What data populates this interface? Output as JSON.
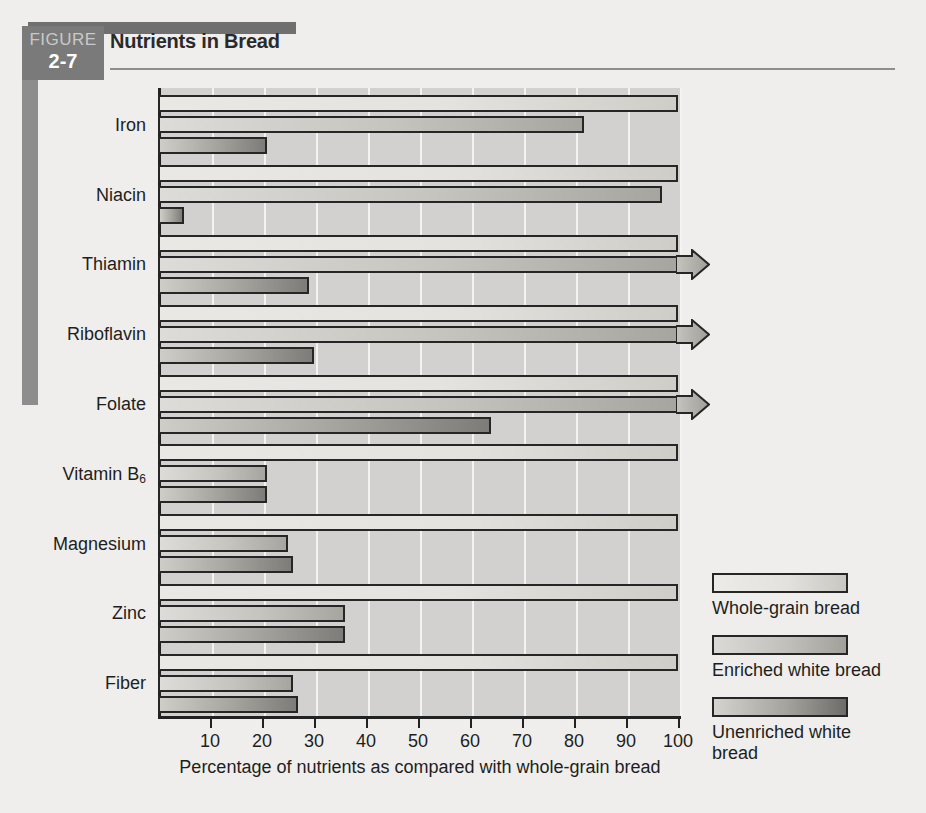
{
  "figure": {
    "badge_word": "FIGURE",
    "badge_number": "2-7",
    "title": "Nutrients in Bread"
  },
  "legend": {
    "entries": [
      {
        "key": "whole",
        "label": "Whole-grain bread"
      },
      {
        "key": "enriched",
        "label": "Enriched white bread"
      },
      {
        "key": "unenriched",
        "label": "Unenriched white bread"
      }
    ]
  },
  "axis": {
    "ticks": [
      10,
      20,
      30,
      40,
      50,
      60,
      70,
      80,
      90,
      100
    ],
    "tick_labels": [
      "10",
      "20",
      "30",
      "40",
      "50",
      "60",
      "70",
      "80",
      "90",
      "100"
    ],
    "xlabel": "Percentage of nutrients as compared with whole-grain bread"
  },
  "chart_data": {
    "type": "bar",
    "orientation": "horizontal",
    "title": "Nutrients in Bread",
    "xlabel": "Percentage of nutrients as compared with whole-grain bread",
    "ylabel": "",
    "xlim": [
      0,
      100
    ],
    "grid": true,
    "legend_position": "right",
    "categories": [
      "Iron",
      "Niacin",
      "Thiamin",
      "Riboflavin",
      "Folate",
      "Vitamin B6",
      "Magnesium",
      "Zinc",
      "Fiber"
    ],
    "category_labels_html": [
      "Iron",
      "Niacin",
      "Thiamin",
      "Riboflavin",
      "Folate",
      "Vitamin B<sub>6</sub>",
      "Magnesium",
      "Zinc",
      "Fiber"
    ],
    "series": [
      {
        "name": "Whole-grain bread",
        "values": [
          100,
          100,
          100,
          100,
          100,
          100,
          100,
          100,
          100
        ],
        "overflow": [
          false,
          false,
          false,
          false,
          false,
          false,
          false,
          false,
          false
        ]
      },
      {
        "name": "Enriched white bread",
        "values": [
          82,
          97,
          100,
          100,
          100,
          21,
          25,
          36,
          26
        ],
        "overflow": [
          false,
          false,
          true,
          true,
          true,
          false,
          false,
          false,
          false
        ]
      },
      {
        "name": "Unenriched white bread",
        "values": [
          21,
          5,
          29,
          30,
          64,
          21,
          26,
          36,
          27
        ],
        "overflow": [
          false,
          false,
          false,
          false,
          false,
          false,
          false,
          false,
          false
        ]
      }
    ]
  }
}
